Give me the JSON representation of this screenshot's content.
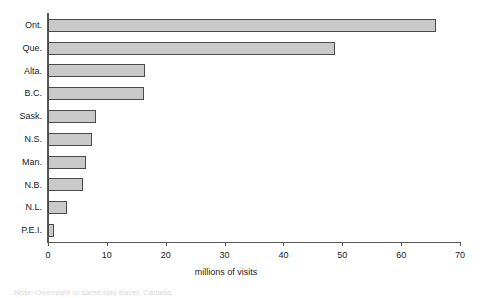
{
  "chart_data": {
    "type": "bar",
    "orientation": "horizontal",
    "title": "",
    "xlabel": "millions of visits",
    "ylabel": "",
    "xlim": [
      0,
      70
    ],
    "xticks": [
      0,
      10,
      20,
      30,
      40,
      50,
      60,
      70
    ],
    "grid": false,
    "legend": null,
    "categories": [
      "Ont.",
      "Que.",
      "Alta.",
      "B.C.",
      "Sask.",
      "N.S.",
      "Man.",
      "N.B.",
      "N.L.",
      "P.E.I."
    ],
    "values": [
      66.0,
      48.8,
      16.5,
      16.3,
      8.2,
      7.5,
      6.4,
      5.9,
      3.3,
      1.1
    ],
    "bar_fill_color": "#c9c9c9",
    "bar_edge_color": "#4a4a4a",
    "axis_color": "#575757"
  },
  "footnote": {
    "clipped_text": "Note: Overnight or same-day travel, Canada."
  }
}
